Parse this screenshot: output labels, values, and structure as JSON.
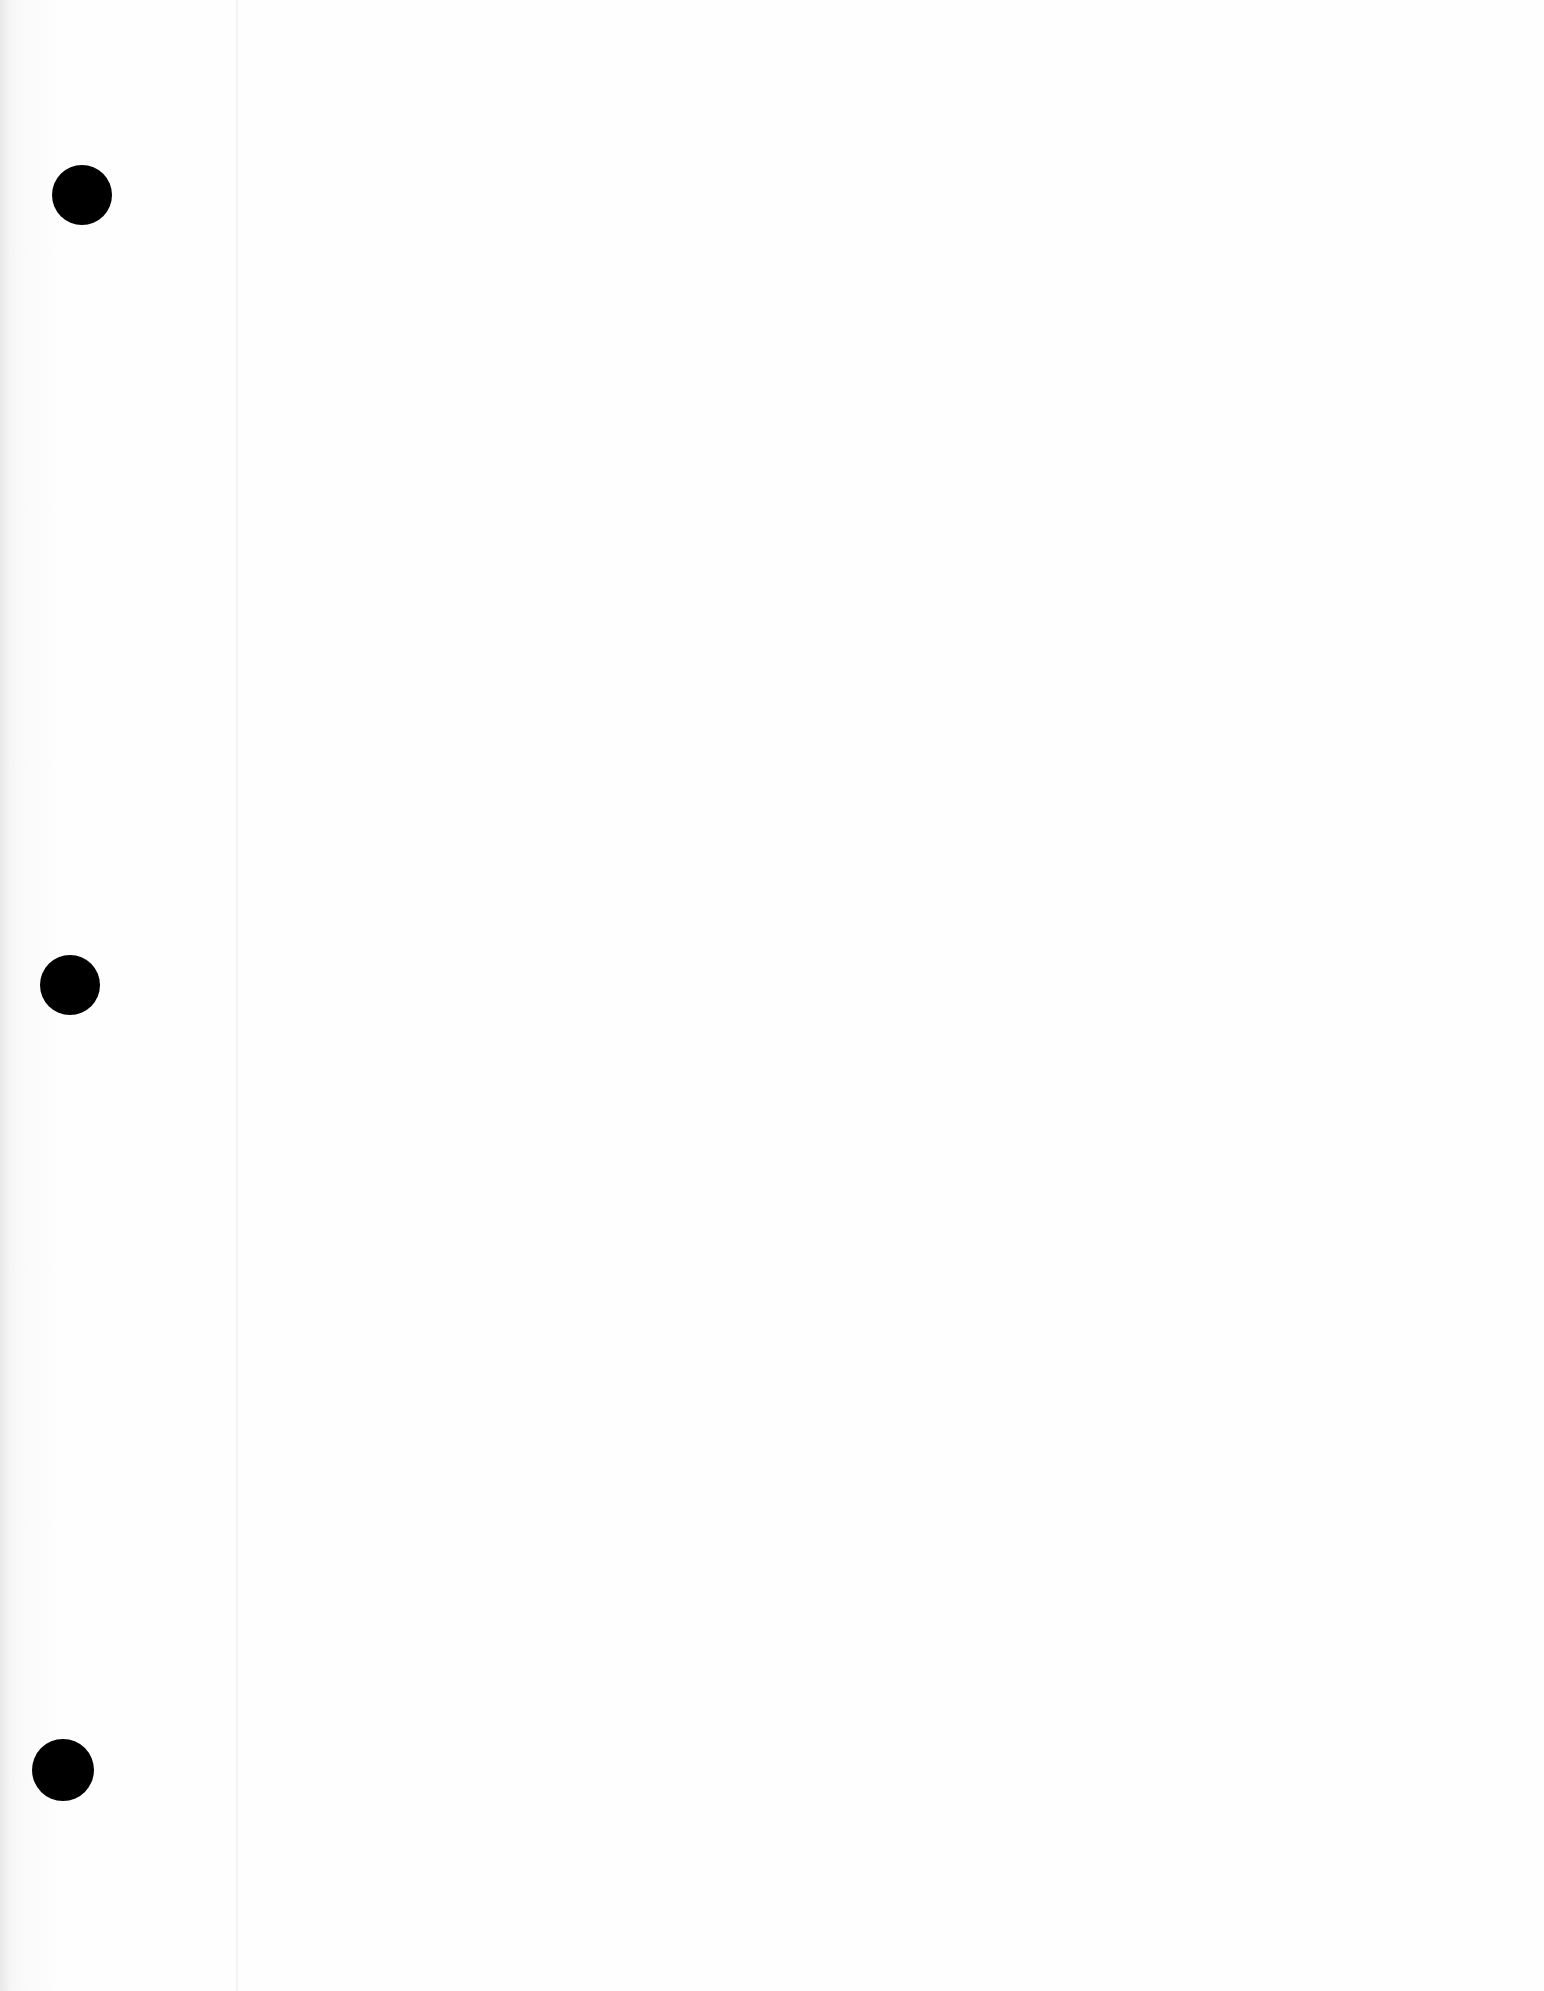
{
  "page": {
    "type": "blank-loose-leaf-sheet",
    "background_color": "#fdfdfd",
    "margin_line_color": "#f3f3f3",
    "punch_holes": [
      {
        "cx": 82,
        "cy": 195,
        "r": 30
      },
      {
        "cx": 70,
        "cy": 985,
        "r": 30
      },
      {
        "cx": 63,
        "cy": 1770,
        "r": 31
      }
    ],
    "punch_hole_color": "#000000",
    "text_content": ""
  }
}
